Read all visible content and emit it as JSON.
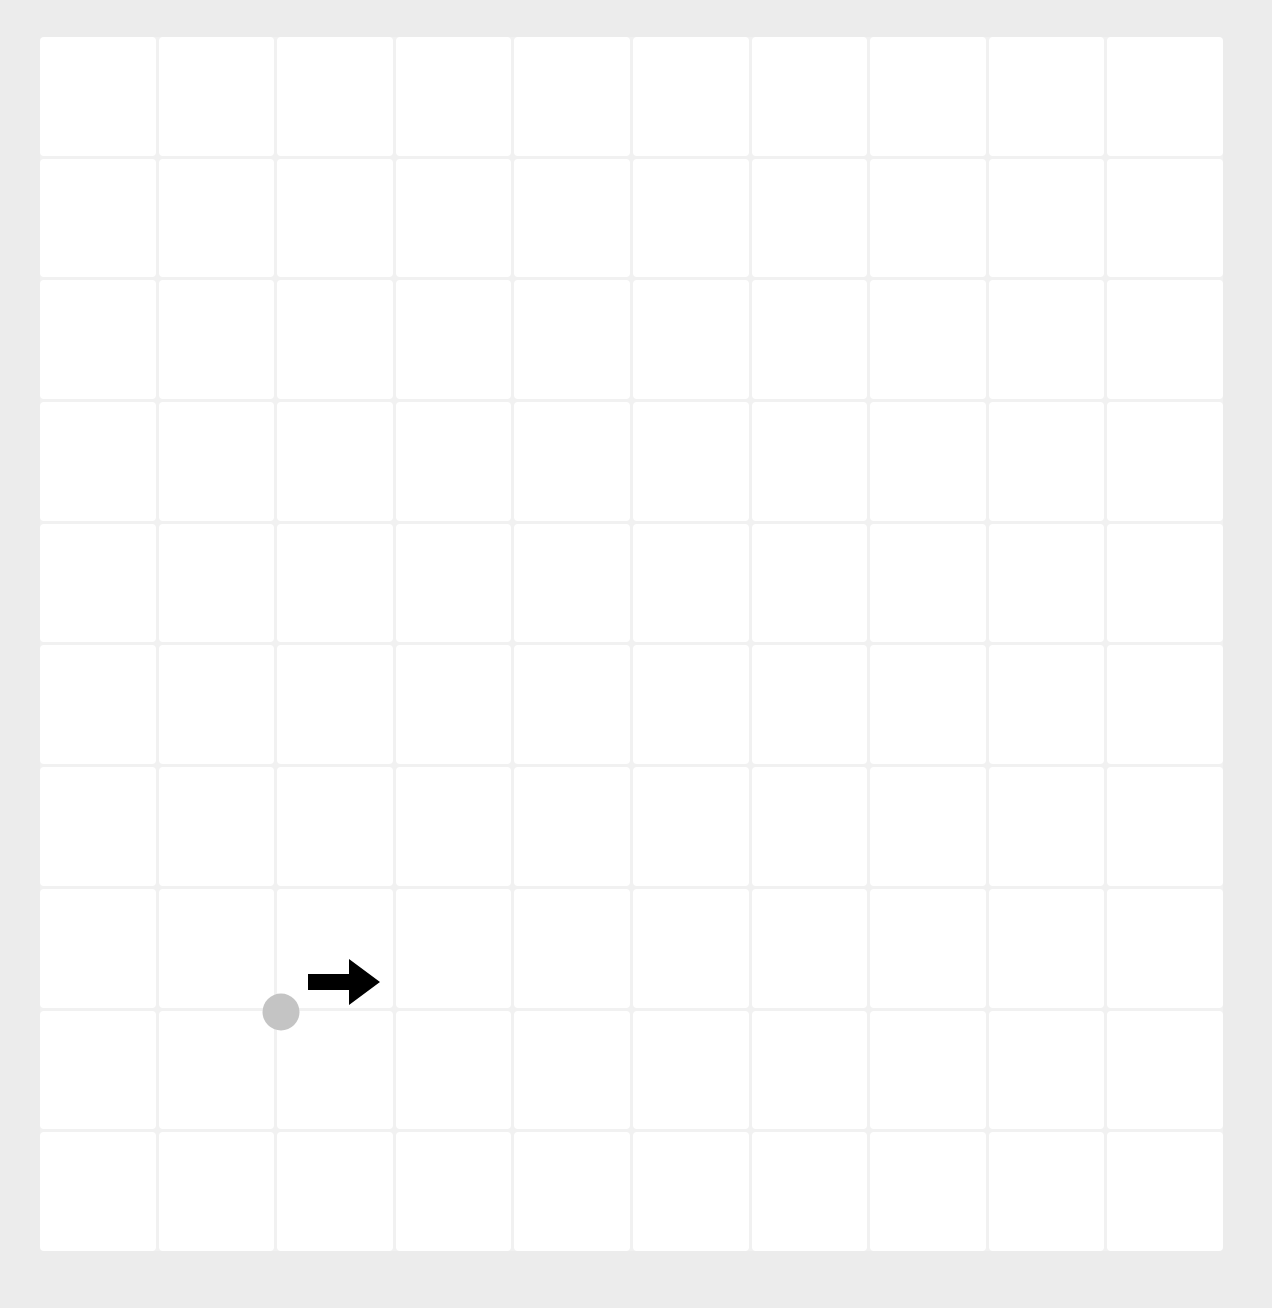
{
  "board": {
    "rows": 10,
    "cols": 10,
    "cell_color": "#ffffff",
    "grid_line_color": "#f1f1f1",
    "background_color": "#ececec"
  },
  "agent": {
    "shape": "circle",
    "color": "#c4c4c4",
    "position_px": {
      "x": 281,
      "y": 1012
    },
    "grid_intersection": {
      "col_line": 2,
      "row_line": 8
    }
  },
  "direction_indicator": {
    "icon": "arrow-right-icon",
    "direction": "right",
    "color": "#000000",
    "position_px": {
      "x": 308,
      "y": 959
    }
  }
}
